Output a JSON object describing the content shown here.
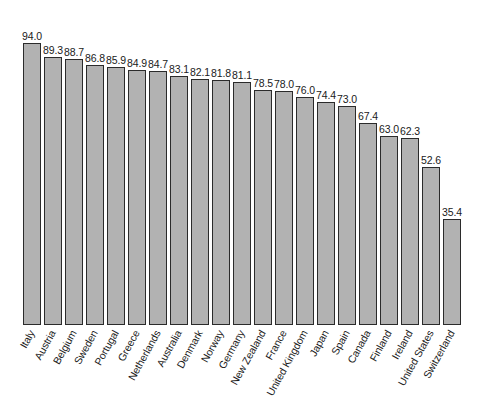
{
  "chart_data": {
    "type": "bar",
    "title": "",
    "subtitle": "",
    "xlabel": "",
    "ylabel": "",
    "ylim": [
      0,
      100
    ],
    "grid": false,
    "legend": null,
    "legend_position": "none",
    "orientation": "vertical",
    "bar_fill_color": "#b2b2b2",
    "bar_edge_color": "#2b2b2b",
    "value_label_format": "one-decimal",
    "x_tick_label_rotation": "-61",
    "categories": [
      "Italy",
      "Austria",
      "Belgium",
      "Sweden",
      "Portugal",
      "Greece",
      "Netherlands",
      "Australia",
      "Denmark",
      "Norway",
      "Germany",
      "New Zealand",
      "France",
      "United Kingdom",
      "Japan",
      "Spain",
      "Canada",
      "Finland",
      "Ireland",
      "United States",
      "Switzerland"
    ],
    "values": [
      94.0,
      89.3,
      88.7,
      86.8,
      85.9,
      84.9,
      84.7,
      83.1,
      82.1,
      81.8,
      81.1,
      78.5,
      78.0,
      76.0,
      74.4,
      73.0,
      67.4,
      63.0,
      62.3,
      52.6,
      35.4
    ],
    "value_labels": [
      "94.0",
      "89.3",
      "88.7",
      "86.8",
      "85.9",
      "84.9",
      "84.7",
      "83.1",
      "82.1",
      "81.8",
      "81.1",
      "78.5",
      "78.0",
      "76.0",
      "74.4",
      "73.0",
      "67.4",
      "63.0",
      "62.3",
      "52.6",
      "35.4"
    ]
  }
}
